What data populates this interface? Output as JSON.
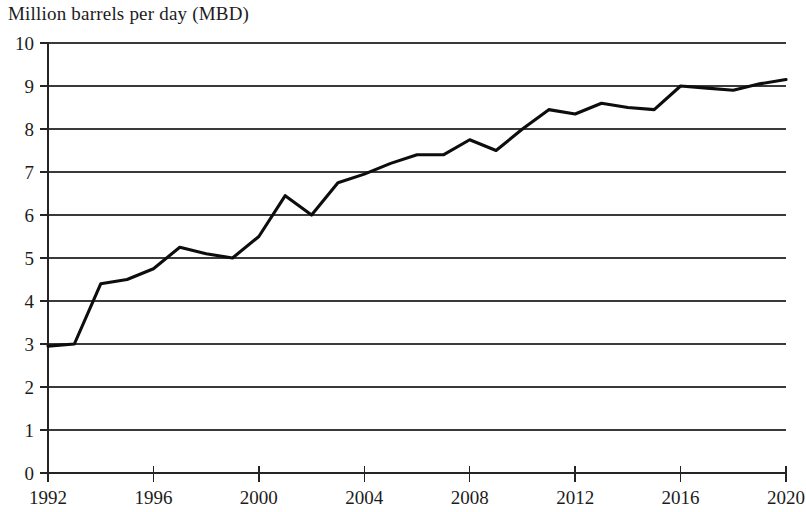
{
  "chart_data": {
    "type": "line",
    "title": "",
    "ylabel": "Million barrels per day (MBD)",
    "xlabel": "",
    "ylim": [
      0,
      10
    ],
    "xlim": [
      1992,
      2020
    ],
    "y_ticks": [
      0,
      1,
      2,
      3,
      4,
      5,
      6,
      7,
      8,
      9,
      10
    ],
    "y_tick_labels": [
      "0",
      "1",
      "2",
      "3",
      "4",
      "5",
      "6",
      "7",
      "8",
      "9",
      "10"
    ],
    "x_ticks": [
      1992,
      1996,
      2000,
      2004,
      2008,
      2012,
      2016,
      2020
    ],
    "x_tick_labels": [
      "1992",
      "1996",
      "2000",
      "2004",
      "2008",
      "2012",
      "2016",
      "2020"
    ],
    "x_minor_step": 1,
    "grid": "horizontal",
    "legend": "none",
    "line_color": "#0d0d0d",
    "x": [
      1992,
      1993,
      1994,
      1995,
      1996,
      1997,
      1998,
      1999,
      2000,
      2001,
      2002,
      2003,
      2004,
      2005,
      2006,
      2007,
      2008,
      2009,
      2010,
      2011,
      2012,
      2013,
      2014,
      2015,
      2016,
      2017,
      2018,
      2019,
      2020
    ],
    "values": [
      2.95,
      3.0,
      4.4,
      4.5,
      4.75,
      5.25,
      5.1,
      5.0,
      5.5,
      6.45,
      6.0,
      6.75,
      6.95,
      7.2,
      7.4,
      7.4,
      7.75,
      7.5,
      8.0,
      8.45,
      8.35,
      8.6,
      8.5,
      8.45,
      9.0,
      8.95,
      8.9,
      9.05,
      9.15
    ],
    "series_name": "Million barrels per day (MBD)"
  },
  "axis_title": "Million barrels per day (MBD)"
}
